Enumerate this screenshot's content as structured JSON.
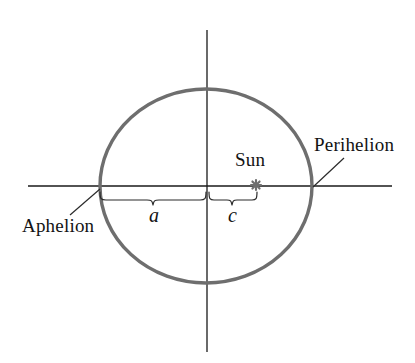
{
  "figure": {
    "background_color": "#ffffff"
  },
  "labels": {
    "aphelion": "Aphelion",
    "perihelion": "Perihelion",
    "sun": "Sun",
    "semi_major_axis": "a",
    "focal_distance": "c"
  },
  "colors": {
    "orbit_stroke": "#6e6e6e",
    "axis_stroke": "#1a1a1a",
    "brace_stroke": "#2b2b2b",
    "leader_stroke": "#2b2b2b",
    "sun_marker": "#707070",
    "text": "#131313"
  },
  "geometry": {
    "ellipse": {
      "center_x": 206,
      "center_y": 186,
      "radius_x": 106,
      "radius_y": 97,
      "stroke_width": 3.4
    },
    "axes": {
      "horizontal_y": 186,
      "horizontal_x1": 28,
      "horizontal_x2": 392,
      "vertical_x": 207,
      "vertical_y1": 30,
      "vertical_y2": 352,
      "stroke_width": 1.3
    },
    "sun_marker": {
      "x": 256,
      "y": 185,
      "size": 9
    },
    "aphelion_point": {
      "x": 100,
      "y": 186
    },
    "perihelion_point": {
      "x": 312,
      "y": 186
    },
    "brace_a": {
      "x1": 100,
      "x2": 206,
      "top_y": 191,
      "depth_y": 203
    },
    "brace_c": {
      "x1": 209,
      "x2": 257,
      "top_y": 191,
      "depth_y": 203
    },
    "leader_aphelion": {
      "x1": 70,
      "y1": 215,
      "x2": 100,
      "y2": 189
    },
    "leader_perihelion": {
      "x1": 344,
      "y1": 158,
      "x2": 313,
      "y2": 187
    }
  }
}
